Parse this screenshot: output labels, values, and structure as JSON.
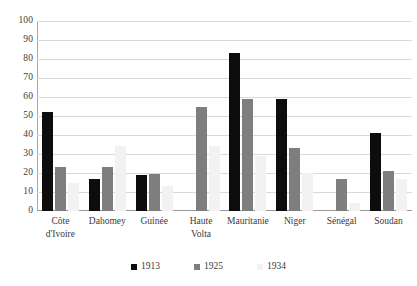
{
  "chart_data": {
    "type": "bar",
    "title": "",
    "xlabel": "",
    "ylabel": "",
    "ylim": [
      0,
      100
    ],
    "ytick_step": 10,
    "yticks": [
      100,
      90,
      80,
      70,
      60,
      50,
      40,
      30,
      20,
      10,
      0
    ],
    "grid": true,
    "legend_position": "bottom",
    "categories": [
      "Côte d'Ivoire",
      "Dahomey",
      "Guinée",
      "Haute Volta",
      "Mauritanie",
      "Niger",
      "Sénégal",
      "Soudan"
    ],
    "category_lines": [
      [
        "Côte",
        "d'Ivoire"
      ],
      [
        "Dahomey"
      ],
      [
        "Guinée"
      ],
      [
        "Haute",
        "Volta"
      ],
      [
        "Mauritanie"
      ],
      [
        "Niger"
      ],
      [
        "Sénégal"
      ],
      [
        "Soudan"
      ]
    ],
    "series": [
      {
        "name": "1913",
        "color": "#0d0d0d",
        "values": [
          52,
          17,
          19,
          null,
          83,
          59,
          null,
          41
        ]
      },
      {
        "name": "1925",
        "color": "#7e7e7e",
        "values": [
          23,
          23,
          19.5,
          55,
          59,
          33,
          17,
          21
        ]
      },
      {
        "name": "1934",
        "color": "#f2f2f2",
        "values": [
          15,
          34,
          13,
          34,
          29,
          20,
          4,
          17
        ]
      }
    ]
  },
  "legend": {
    "items": [
      {
        "label": "1913",
        "color": "#0d0d0d"
      },
      {
        "label": "1925",
        "color": "#7e7e7e"
      },
      {
        "label": "1934",
        "color": "#f2f2f2"
      }
    ]
  }
}
